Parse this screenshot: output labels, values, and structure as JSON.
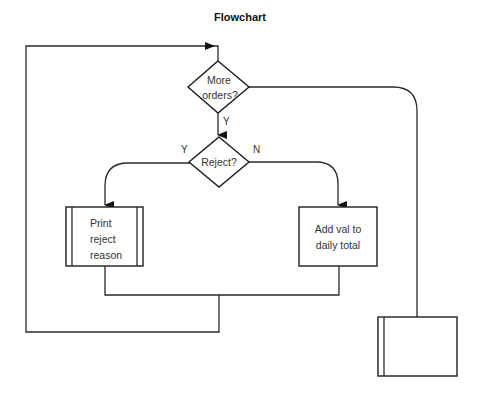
{
  "title": "Flowchart",
  "nodes": {
    "more_orders": {
      "line1": "More",
      "line2": "orders?"
    },
    "reject": {
      "label": "Reject?"
    },
    "print_reject": {
      "line1": "Print",
      "line2": "reject",
      "line3": "reason"
    },
    "add_val": {
      "line1": "Add val to",
      "line2": "daily total"
    },
    "end_box": {
      "label": ""
    }
  },
  "edges": {
    "more_yes": "Y",
    "reject_yes": "Y",
    "reject_no": "N"
  }
}
